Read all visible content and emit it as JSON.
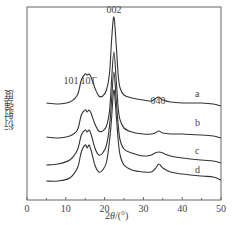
{
  "chart_data": {
    "type": "line",
    "title": "",
    "xlabel": "2θ/(°)",
    "xlabel_prefix": "2",
    "xlabel_theta": "θ",
    "xlabel_suffix": "/(°)",
    "ylabel": "衍射强度",
    "xlim": [
      0,
      50
    ],
    "xticks": [
      0,
      10,
      20,
      30,
      40,
      50
    ],
    "minor_xticks": [
      5,
      15,
      25,
      35,
      45
    ],
    "yticks": [],
    "grid": false,
    "legend": "inline labels at right end of curves",
    "annotations": [
      {
        "text": "002",
        "x": 22.4,
        "px": [
          114,
          5
        ]
      },
      {
        "text": "101",
        "x": 13.5,
        "px": [
          71,
          76
        ]
      },
      {
        "text": "101̄",
        "x": 17.2,
        "px": [
          88,
          76
        ]
      },
      {
        "text": "040",
        "x": 34.0,
        "px": [
          158,
          96
        ]
      }
    ],
    "series": [
      {
        "name": "a",
        "label_px": [
          189,
          101
        ],
        "x": [
          5,
          8,
          11,
          13,
          14,
          15,
          15.5,
          16,
          16.5,
          17.5,
          18.5,
          19.5,
          20.5,
          21.3,
          21.8,
          22.4,
          23,
          23.5,
          24,
          25,
          27,
          30,
          32,
          33,
          34,
          35,
          37,
          40,
          45,
          48,
          50
        ],
        "y": [
          97,
          96,
          98,
          105,
          120,
          126,
          125,
          126,
          123,
          112,
          104,
          104,
          110,
          128,
          160,
          183,
          155,
          125,
          112,
          105,
          102,
          100,
          99,
          101,
          103,
          100,
          98,
          97,
          97,
          96,
          94
        ]
      },
      {
        "name": "b",
        "label_px": [
          189,
          130
        ],
        "x": [
          5,
          8,
          11,
          13,
          14,
          15,
          15.5,
          16,
          16.5,
          17.5,
          18.5,
          19.5,
          20.5,
          21.3,
          21.8,
          22.4,
          23,
          23.5,
          24,
          25,
          27,
          30,
          32,
          33,
          34,
          35,
          37,
          40,
          45,
          48,
          50
        ],
        "y": [
          63,
          62,
          64,
          70,
          85,
          90,
          88,
          90,
          87,
          76,
          69,
          69,
          74,
          90,
          120,
          148,
          120,
          92,
          80,
          72,
          68,
          66,
          66,
          67,
          69,
          67,
          66,
          66,
          65,
          64,
          62
        ]
      },
      {
        "name": "c",
        "label_px": [
          189,
          158
        ],
        "x": [
          5,
          8,
          11,
          13,
          14,
          15,
          15.5,
          16,
          16.5,
          17.5,
          18.5,
          19.5,
          20.5,
          21.3,
          21.8,
          22.4,
          23,
          23.5,
          24,
          25,
          27,
          30,
          32,
          33,
          34,
          35,
          37,
          40,
          45,
          48,
          50
        ],
        "y": [
          35,
          36,
          40,
          50,
          65,
          70,
          68,
          70,
          66,
          52,
          45,
          47,
          55,
          75,
          100,
          128,
          100,
          75,
          60,
          51,
          47,
          44,
          45,
          47,
          48,
          47,
          44,
          42,
          40,
          39,
          37
        ]
      },
      {
        "name": "d",
        "label_px": [
          189,
          177
        ],
        "x": [
          5,
          8,
          11,
          13,
          14,
          15,
          15.5,
          16,
          16.5,
          17.5,
          18.5,
          19.5,
          20.5,
          21.3,
          21.8,
          22.4,
          23,
          23.5,
          24,
          25,
          27,
          30,
          32,
          33,
          34,
          35,
          37,
          40,
          45,
          48,
          50
        ],
        "y": [
          19,
          19,
          22,
          32,
          48,
          55,
          52,
          55,
          50,
          35,
          28,
          30,
          38,
          60,
          82,
          110,
          85,
          60,
          45,
          35,
          30,
          28,
          28,
          31,
          36,
          32,
          28,
          26,
          24,
          23,
          20
        ]
      }
    ],
    "colors": {
      "line": "#333333",
      "frame": "#555555",
      "text": "#444444"
    }
  }
}
